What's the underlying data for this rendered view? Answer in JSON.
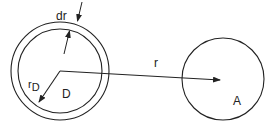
{
  "diagram": {
    "labels": {
      "dr": "dr",
      "r_D_main": "r",
      "r_D_sub": "D",
      "D": "D",
      "r": "r",
      "A": "A"
    },
    "colors": {
      "stroke": "#222222",
      "background": "#ffffff"
    }
  }
}
